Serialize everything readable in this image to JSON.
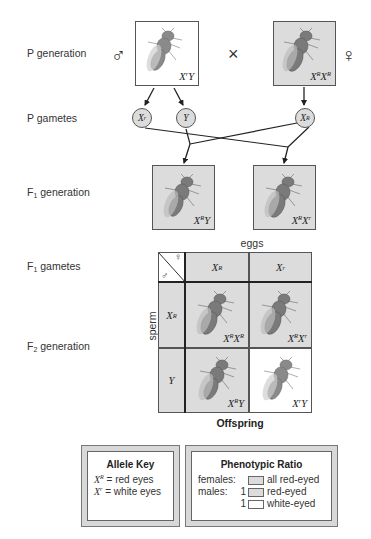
{
  "labels": {
    "p_generation": "P generation",
    "p_gametes": "P gametes",
    "f1_generation": {
      "prefix": "F",
      "sub": "1",
      "suffix": " generation"
    },
    "f1_gametes": {
      "prefix": "F",
      "sub": "1",
      "suffix": " gametes"
    },
    "f2_generation": {
      "prefix": "F",
      "sub": "2",
      "suffix": " generation"
    }
  },
  "symbols": {
    "male": "♂",
    "female": "♀",
    "cross": "×"
  },
  "p_generation": {
    "male": {
      "base1": "X",
      "sup1": "r",
      "base2": "Y",
      "sup2": "",
      "shade": "white"
    },
    "female": {
      "base1": "X",
      "sup1": "R",
      "base2": "X",
      "sup2": "R",
      "shade": "gray"
    }
  },
  "p_gametes": [
    {
      "base": "X",
      "sup": "r"
    },
    {
      "base": "Y",
      "sup": ""
    },
    {
      "base": "X",
      "sup": "R"
    }
  ],
  "f1_generation": [
    {
      "base1": "X",
      "sup1": "R",
      "base2": "Y",
      "sup2": "",
      "shade": "gray"
    },
    {
      "base1": "X",
      "sup1": "R",
      "base2": "X",
      "sup2": "r",
      "shade": "gray"
    }
  ],
  "punnett": {
    "top_label": "eggs",
    "side_label": "sperm",
    "bottom_label": "Offspring",
    "corner": {
      "female": "♀",
      "male": "♂"
    },
    "columns": [
      {
        "base": "X",
        "sup": "R"
      },
      {
        "base": "X",
        "sup": "r"
      }
    ],
    "rows": [
      {
        "base": "X",
        "sup": "R"
      },
      {
        "base": "Y",
        "sup": ""
      }
    ],
    "cells": [
      [
        {
          "base1": "X",
          "sup1": "R",
          "base2": "X",
          "sup2": "R",
          "shade": "gray"
        },
        {
          "base1": "X",
          "sup1": "R",
          "base2": "X",
          "sup2": "r",
          "shade": "gray"
        }
      ],
      [
        {
          "base1": "X",
          "sup1": "R",
          "base2": "Y",
          "sup2": "",
          "shade": "gray"
        },
        {
          "base1": "X",
          "sup1": "r",
          "base2": "Y",
          "sup2": "",
          "shade": "white"
        }
      ]
    ]
  },
  "allele_key": {
    "title": "Allele Key",
    "entries": [
      {
        "base": "X",
        "sup": "R",
        "eq": " = ",
        "meaning": "red eyes"
      },
      {
        "base": "X",
        "sup": "r",
        "eq": " = ",
        "meaning": "white eyes"
      }
    ]
  },
  "phenotypic_ratio": {
    "title": "Phenotypic Ratio",
    "rows": [
      {
        "sex": "females:",
        "count": "",
        "swatch": "gray",
        "phenotype": "all red-eyed"
      },
      {
        "sex": "males:",
        "count": "1",
        "swatch": "gray",
        "phenotype": "red-eyed"
      },
      {
        "sex": "",
        "count": "1",
        "swatch": "white",
        "phenotype": "white-eyed"
      }
    ]
  },
  "colors": {
    "red_eyed_shade": "#dcdcdc",
    "white_eyed_shade": "#ffffff",
    "line": "#222222",
    "border": "#555555"
  }
}
